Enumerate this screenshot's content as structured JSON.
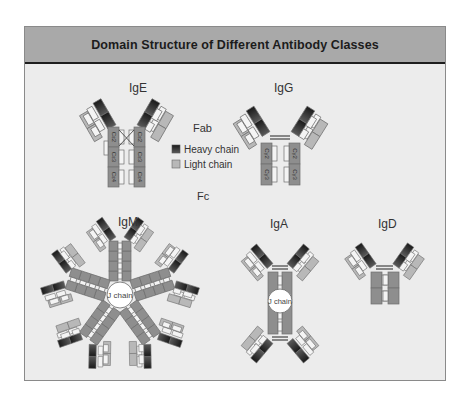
{
  "title": "Domain Structure of Different Antibody Classes",
  "colors": {
    "heavy": "#2a2a2a",
    "heavy_grad": "#555555",
    "heavy_stem": "#8e8e8e",
    "light": "#b8b8b8",
    "outline": "#6e6e6e",
    "white_box": "#f4f4f4",
    "background": "#ececec",
    "header": "#a9a9a9"
  },
  "labels": {
    "fab": "Fab",
    "fc": "Fc",
    "j_chain": "J chain"
  },
  "legend": {
    "items": [
      {
        "label": "Heavy chain",
        "swatch": "heavy"
      },
      {
        "label": "Light chain",
        "swatch": "light"
      }
    ]
  },
  "antibodies": [
    {
      "name": "IgE",
      "label": "IgE",
      "constant_domains": [
        "Cε2",
        "Cε3",
        "Cε4"
      ],
      "units": 1
    },
    {
      "name": "IgG",
      "label": "IgG",
      "constant_domains": [
        "Cγ2",
        "Cγ3"
      ],
      "units": 1
    },
    {
      "name": "IgM",
      "label": "IgM",
      "units": 5,
      "has_j_chain": true
    },
    {
      "name": "IgA",
      "label": "IgA",
      "units": 2,
      "has_j_chain": true
    },
    {
      "name": "IgD",
      "label": "IgD",
      "units": 1
    }
  ],
  "domain_labels": {
    "variable": "V",
    "constant": "C"
  }
}
